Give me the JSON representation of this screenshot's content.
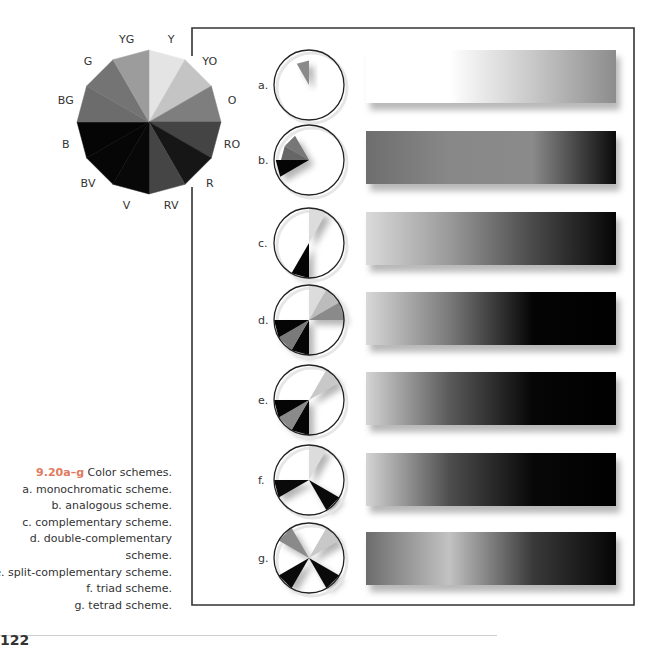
{
  "figure": {
    "number": "9.20a–g",
    "title": "Color schemes.",
    "captions": [
      "a. monochromatic scheme.",
      "b. analogous scheme.",
      "c. complementary scheme.",
      "d. double-complementary",
      "scheme.",
      "e. split-complementary scheme.",
      "f. triad scheme.",
      "g. tetrad scheme."
    ],
    "accent_color": "#e07a5f"
  },
  "color_wheel": {
    "center": [
      149,
      122
    ],
    "radius": 72,
    "segments": [
      {
        "label": "Y",
        "shade": "#e4e4e4"
      },
      {
        "label": "YO",
        "shade": "#c4c4c4"
      },
      {
        "label": "O",
        "shade": "#7e7e7e"
      },
      {
        "label": "RO",
        "shade": "#444444"
      },
      {
        "label": "R",
        "shade": "#161616"
      },
      {
        "label": "RV",
        "shade": "#454545"
      },
      {
        "label": "V",
        "shade": "#080808"
      },
      {
        "label": "BV",
        "shade": "#060606"
      },
      {
        "label": "B",
        "shade": "#050505"
      },
      {
        "label": "BG",
        "shade": "#6c6c6c"
      },
      {
        "label": "G",
        "shade": "#747474"
      },
      {
        "label": "YG",
        "shade": "#9c9c9c"
      }
    ]
  },
  "schemes": [
    {
      "label": "a.",
      "name": "monochromatic",
      "slices": [
        {
          "index": 11,
          "shade": "#8a8a8a",
          "r": 0.7
        }
      ],
      "gradient": [
        "#ffffff",
        "#ffffff",
        "#c8c8c8",
        "#8c8c8c"
      ]
    },
    {
      "label": "b.",
      "name": "analogous",
      "slices": [
        {
          "index": 10,
          "shade": "#777777",
          "r": 0.8
        },
        {
          "index": 9,
          "shade": "#666666",
          "r": 0.8
        },
        {
          "index": 8,
          "shade": "#050505",
          "r": 0.95
        }
      ],
      "gradient": [
        "#6e6e6e",
        "#888888",
        "#8a8a8a",
        "#0a0a0a"
      ]
    },
    {
      "label": "c.",
      "name": "complementary",
      "slices": [
        {
          "index": 0,
          "shade": "#dcdcdc",
          "r": 1
        },
        {
          "index": 6,
          "shade": "#050505",
          "r": 1
        }
      ],
      "gradient": [
        "#dadada",
        "#9a9a9a",
        "#4a4a4a",
        "#050505"
      ]
    },
    {
      "label": "d.",
      "name": "double-complementary",
      "slices": [
        {
          "index": 0,
          "shade": "#dcdcdc",
          "r": 1
        },
        {
          "index": 1,
          "shade": "#bcbcbc",
          "r": 1
        },
        {
          "index": 2,
          "shade": "#8a8a8a",
          "r": 1
        },
        {
          "index": 6,
          "shade": "#050505",
          "r": 1
        },
        {
          "index": 7,
          "shade": "#7a7a7a",
          "r": 1
        },
        {
          "index": 8,
          "shade": "#050505",
          "r": 1
        }
      ],
      "gradient": [
        "#d8d8d8",
        "#7a7a7a",
        "#050505",
        "#000000"
      ]
    },
    {
      "label": "e.",
      "name": "split-complementary",
      "slices": [
        {
          "index": 1,
          "shade": "#c8c8c8",
          "r": 1
        },
        {
          "index": 6,
          "shade": "#050505",
          "r": 1
        },
        {
          "index": 7,
          "shade": "#8a8a8a",
          "r": 1
        },
        {
          "index": 8,
          "shade": "#050505",
          "r": 1
        }
      ],
      "gradient": [
        "#d4d4d4",
        "#5a5a5a",
        "#060606",
        "#000000"
      ]
    },
    {
      "label": "f.",
      "name": "triad",
      "slices": [
        {
          "index": 0,
          "shade": "#dcdcdc",
          "r": 1
        },
        {
          "index": 4,
          "shade": "#0a0a0a",
          "r": 1
        },
        {
          "index": 8,
          "shade": "#0a0a0a",
          "r": 1
        }
      ],
      "gradient": [
        "#d4d4d4",
        "#4e4e4e",
        "#080808",
        "#000000"
      ]
    },
    {
      "label": "g.",
      "name": "tetrad",
      "slices": [
        {
          "index": 1,
          "shade": "#c8c8c8",
          "r": 1
        },
        {
          "index": 4,
          "shade": "#0a0a0a",
          "r": 1
        },
        {
          "index": 7,
          "shade": "#0a0a0a",
          "r": 1
        },
        {
          "index": 10,
          "shade": "#8a8a8a",
          "r": 1
        }
      ],
      "gradient": [
        "#6c6c6c",
        "#c2c2c2",
        "#3a3a3a",
        "#050505"
      ]
    }
  ],
  "page": {
    "number": "122"
  }
}
